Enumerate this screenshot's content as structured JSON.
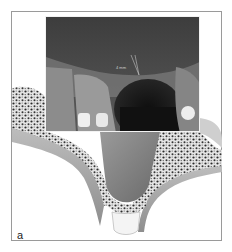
{
  "figure": {
    "panel_label": "a",
    "radiograph": {
      "measurement_label": "4 mm",
      "measurement_arrow": "arrow indicating residual bone height"
    },
    "colors": {
      "frame_border": "#9a9a9a",
      "xray_dark": "#1a1a1a",
      "xray_mid": "#6e6e6e",
      "bone_fill": "#d8d8d8",
      "cortex_gray": "#a8a8a8",
      "restoration_white": "#eeeeee"
    }
  }
}
